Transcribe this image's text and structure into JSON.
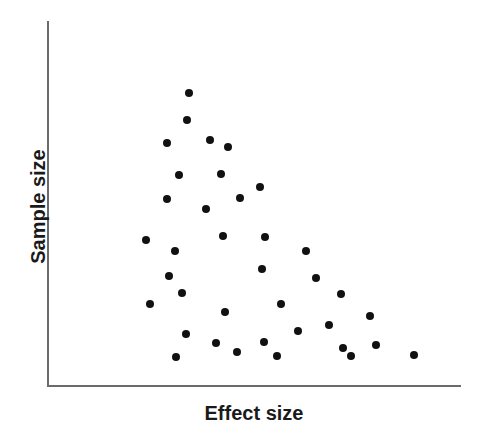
{
  "figure": {
    "width": 481,
    "height": 438,
    "background": "#ffffff"
  },
  "axes": {
    "x_label": "Effect size",
    "y_label": "Sample size",
    "line_color": "#6b6b6b",
    "x_axis": {
      "x_start_px": 47,
      "x_end_px": 461,
      "y_px": 386
    },
    "y_axis": {
      "y_start_px": 21,
      "y_end_px": 387,
      "x_px": 48
    }
  },
  "marker": {
    "color": "#111111",
    "shape": "circle",
    "diameter_px": 8
  },
  "chart_data": {
    "type": "scatter",
    "title": "",
    "subtitle": "",
    "xlabel": "Effect size",
    "ylabel": "Sample size",
    "grid": false,
    "legend": false,
    "axis_ticks": false,
    "xlim": [
      0,
      1
    ],
    "ylim": [
      0,
      1
    ],
    "note": "Funnel plot showing asymmetric scatter of studies: small-sample studies spread toward larger effect sizes (publication bias pattern). Values are normalized 0-1 positions read off the plotting box; no numeric tick labels are printed on the axes.",
    "n_points": 37,
    "points": [
      {
        "x": 0.344,
        "y": 0.802
      },
      {
        "x": 0.337,
        "y": 0.728
      },
      {
        "x": 0.291,
        "y": 0.667
      },
      {
        "x": 0.394,
        "y": 0.675
      },
      {
        "x": 0.438,
        "y": 0.656
      },
      {
        "x": 0.32,
        "y": 0.577
      },
      {
        "x": 0.42,
        "y": 0.582
      },
      {
        "x": 0.514,
        "y": 0.546
      },
      {
        "x": 0.291,
        "y": 0.511
      },
      {
        "x": 0.467,
        "y": 0.514
      },
      {
        "x": 0.383,
        "y": 0.484
      },
      {
        "x": 0.239,
        "y": 0.401
      },
      {
        "x": 0.425,
        "y": 0.412
      },
      {
        "x": 0.526,
        "y": 0.407
      },
      {
        "x": 0.309,
        "y": 0.369
      },
      {
        "x": 0.625,
        "y": 0.369
      },
      {
        "x": 0.294,
        "y": 0.301
      },
      {
        "x": 0.52,
        "y": 0.32
      },
      {
        "x": 0.649,
        "y": 0.295
      },
      {
        "x": 0.326,
        "y": 0.254
      },
      {
        "x": 0.709,
        "y": 0.252
      },
      {
        "x": 0.248,
        "y": 0.224
      },
      {
        "x": 0.565,
        "y": 0.224
      },
      {
        "x": 0.431,
        "y": 0.202
      },
      {
        "x": 0.779,
        "y": 0.191
      },
      {
        "x": 0.335,
        "y": 0.142
      },
      {
        "x": 0.681,
        "y": 0.166
      },
      {
        "x": 0.607,
        "y": 0.15
      },
      {
        "x": 0.408,
        "y": 0.117
      },
      {
        "x": 0.524,
        "y": 0.12
      },
      {
        "x": 0.794,
        "y": 0.112
      },
      {
        "x": 0.458,
        "y": 0.093
      },
      {
        "x": 0.714,
        "y": 0.104
      },
      {
        "x": 0.312,
        "y": 0.08
      },
      {
        "x": 0.555,
        "y": 0.082
      },
      {
        "x": 0.734,
        "y": 0.082
      },
      {
        "x": 0.886,
        "y": 0.085
      }
    ]
  }
}
